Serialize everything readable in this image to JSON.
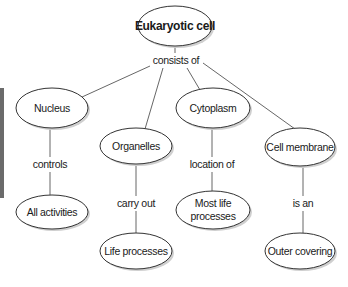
{
  "diagram": {
    "type": "concept-map",
    "root": {
      "label": "Eukaryotic cell",
      "link": "consists of"
    },
    "branches": [
      {
        "label": "Nucleus",
        "link": "controls",
        "child": [
          "All activities"
        ]
      },
      {
        "label": "Organelles",
        "link": "carry out",
        "child": [
          "Life processes"
        ]
      },
      {
        "label": "Cytoplasm",
        "link": "location of",
        "child": [
          "Most life",
          "processes"
        ]
      },
      {
        "label": "Cell membrane",
        "link": "is an",
        "child": [
          "Outer covering"
        ]
      }
    ]
  },
  "colors": {
    "line": "#555555",
    "ellipse_stroke": "#333333",
    "ellipse_fill": "#ffffff",
    "shadow": "#c8c8c8",
    "side_bar": "#6b6b6b"
  }
}
